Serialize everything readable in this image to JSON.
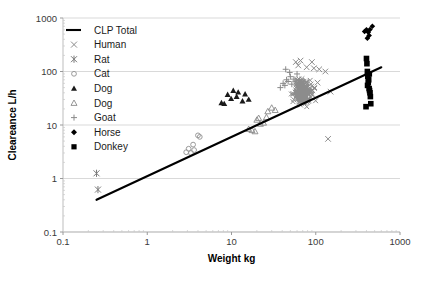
{
  "chart_data": {
    "type": "scatter",
    "title": "",
    "xlabel": "Weight kg",
    "ylabel": "Cleareance L/h",
    "xscale": "log",
    "yscale": "log",
    "xlim": [
      0.1,
      1000
    ],
    "ylim": [
      0.1,
      1000
    ],
    "xticks": [
      "0.1",
      "1",
      "10",
      "100",
      "1000"
    ],
    "yticks": [
      "0.1",
      "1",
      "10",
      "100",
      "1000"
    ],
    "grid": "horizontal",
    "legend_position": "top-left",
    "legend": [
      {
        "label": "CLP Total",
        "marker": "line",
        "color": "#000000"
      },
      {
        "label": "Human",
        "marker": "cross-x",
        "color": "#8c8c8c"
      },
      {
        "label": "Rat",
        "marker": "asterisk",
        "color": "#7a7a7a"
      },
      {
        "label": "Cat",
        "marker": "circle-open",
        "color": "#9a9a9a"
      },
      {
        "label": "Dog",
        "marker": "triangle-fill",
        "color": "#1a1a1a"
      },
      {
        "label": "Dog",
        "marker": "triangle-open",
        "color": "#8a8a8a"
      },
      {
        "label": "Goat",
        "marker": "plus",
        "color": "#8a8a8a"
      },
      {
        "label": "Horse",
        "marker": "diamond-fill",
        "color": "#000000"
      },
      {
        "label": "Donkey",
        "marker": "square-fill",
        "color": "#000000"
      }
    ],
    "fit_line": {
      "name": "CLP Total",
      "x": [
        0.25,
        600
      ],
      "y": [
        0.4,
        120
      ]
    },
    "series": [
      {
        "name": "Rat",
        "marker": "asterisk",
        "color": "#7a7a7a",
        "points": [
          [
            0.25,
            1.25
          ],
          [
            0.26,
            0.62
          ]
        ]
      },
      {
        "name": "Cat",
        "marker": "circle-open",
        "color": "#9a9a9a",
        "points": [
          [
            2.9,
            3.1
          ],
          [
            3.1,
            3.6
          ],
          [
            3.3,
            3.0
          ],
          [
            3.5,
            4.3
          ],
          [
            3.6,
            3.4
          ],
          [
            4.0,
            6.4
          ],
          [
            4.2,
            6.0
          ]
        ]
      },
      {
        "name": "Dog",
        "marker": "triangle-fill",
        "color": "#1a1a1a",
        "points": [
          [
            7.6,
            26
          ],
          [
            8.2,
            25
          ],
          [
            9.0,
            37
          ],
          [
            9.9,
            31
          ],
          [
            10.5,
            44
          ],
          [
            11.5,
            34
          ],
          [
            12.0,
            41
          ],
          [
            13.5,
            28
          ],
          [
            14.5,
            38
          ],
          [
            16.0,
            30
          ]
        ]
      },
      {
        "name": "Dog",
        "marker": "triangle-open",
        "color": "#8a8a8a",
        "points": [
          [
            16.0,
            8.4
          ],
          [
            17.5,
            8.0
          ],
          [
            19.0,
            7.6
          ],
          [
            20.0,
            12.5
          ],
          [
            21.0,
            13.5
          ],
          [
            22.0,
            10.5
          ],
          [
            24.0,
            11.0
          ],
          [
            26.0,
            14.0
          ],
          [
            27.0,
            18.0
          ],
          [
            30.0,
            21.0
          ],
          [
            33.0,
            19.0
          ]
        ]
      },
      {
        "name": "Goat",
        "marker": "plus",
        "color": "#8a8a8a",
        "points": [
          [
            38,
            50
          ],
          [
            41,
            60
          ],
          [
            43,
            55
          ],
          [
            45,
            70
          ],
          [
            47,
            65
          ],
          [
            50,
            80
          ],
          [
            52,
            58
          ],
          [
            55,
            72
          ],
          [
            57,
            66
          ],
          [
            60,
            90
          ],
          [
            44,
            110
          ],
          [
            49,
            96
          ]
        ]
      },
      {
        "name": "Human",
        "marker": "cross-x",
        "color": "#8c8c8c",
        "cluster": {
          "cx": 70,
          "cy": 42,
          "n": 230,
          "x_spread_log": 0.09,
          "y_spread_log": 0.17
        },
        "outliers": [
          [
            62,
            130
          ],
          [
            78,
            120
          ],
          [
            95,
            115
          ],
          [
            110,
            110
          ],
          [
            130,
            100
          ],
          [
            150,
            42
          ],
          [
            90,
            150
          ],
          [
            105,
            62
          ],
          [
            140,
            5.5
          ],
          [
            58,
            150
          ],
          [
            66,
            160
          ]
        ]
      },
      {
        "name": "Horse",
        "marker": "diamond-fill",
        "color": "#000000",
        "points": [
          [
            380,
            560
          ],
          [
            400,
            600
          ],
          [
            420,
            540
          ],
          [
            440,
            610
          ],
          [
            470,
            700
          ],
          [
            410,
            420
          ],
          [
            430,
            470
          ]
        ]
      },
      {
        "name": "Donkey",
        "marker": "square-fill",
        "color": "#000000",
        "points": [
          [
            400,
            175
          ],
          [
            405,
            140
          ],
          [
            410,
            100
          ],
          [
            415,
            80
          ],
          [
            420,
            62
          ],
          [
            425,
            70
          ],
          [
            430,
            48
          ],
          [
            435,
            44
          ],
          [
            440,
            40
          ],
          [
            445,
            34
          ],
          [
            450,
            25
          ],
          [
            395,
            22
          ],
          [
            412,
            55
          ],
          [
            432,
            90
          ]
        ]
      }
    ]
  }
}
